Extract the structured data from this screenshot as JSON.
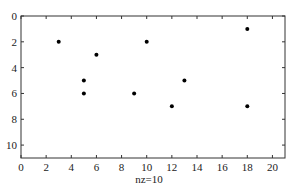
{
  "chart_data": {
    "type": "scatter",
    "title": "",
    "xlabel": "nz=10",
    "ylabel": "",
    "xlim": [
      0,
      21
    ],
    "ylim": [
      11,
      0
    ],
    "y_reversed": true,
    "grid": false,
    "legend": null,
    "x_ticks": [
      0,
      2,
      4,
      6,
      8,
      10,
      12,
      14,
      16,
      18,
      20
    ],
    "y_ticks": [
      0,
      2,
      4,
      6,
      8,
      10
    ],
    "points": [
      {
        "x": 3,
        "y": 2
      },
      {
        "x": 5,
        "y": 5
      },
      {
        "x": 5,
        "y": 6
      },
      {
        "x": 6,
        "y": 3
      },
      {
        "x": 9,
        "y": 6
      },
      {
        "x": 10,
        "y": 2
      },
      {
        "x": 12,
        "y": 7
      },
      {
        "x": 13,
        "y": 5
      },
      {
        "x": 18,
        "y": 1
      },
      {
        "x": 18,
        "y": 7
      }
    ],
    "marker_color": "#000000",
    "axis_color": "#333333"
  }
}
